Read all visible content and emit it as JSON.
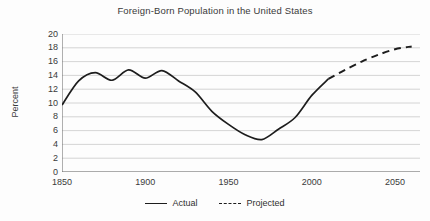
{
  "chart_data": {
    "type": "line",
    "title": "Foreign-Born Population in the United States",
    "xlabel": "",
    "ylabel": "Percent",
    "xlim": [
      1850,
      2065
    ],
    "ylim": [
      0,
      20
    ],
    "xticks": [
      1850,
      1900,
      1950,
      2000,
      2050
    ],
    "xtick_labels": [
      "1850",
      "1900",
      "1950",
      "2000",
      "2050"
    ],
    "yticks": [
      0,
      2,
      4,
      6,
      8,
      10,
      12,
      14,
      16,
      18,
      20
    ],
    "ytick_labels": [
      "0",
      "2",
      "4",
      "6",
      "8",
      "10",
      "12",
      "14",
      "16",
      "18",
      "20"
    ],
    "grid": "horizontal",
    "legend_position": "bottom-center",
    "line_color": "#1d1d1d",
    "grid_color": "#c9c9c9",
    "axis_color": "#6e6e6e",
    "series": [
      {
        "name": "Actual",
        "style": "solid",
        "x": [
          1850,
          1860,
          1870,
          1880,
          1890,
          1900,
          1910,
          1920,
          1930,
          1940,
          1950,
          1960,
          1970,
          1980,
          1990,
          2000,
          2010
        ],
        "values": [
          9.7,
          13.2,
          14.4,
          13.3,
          14.8,
          13.6,
          14.7,
          13.2,
          11.6,
          8.8,
          6.9,
          5.4,
          4.7,
          6.2,
          7.9,
          11.1,
          13.5
        ]
      },
      {
        "name": "Projected",
        "style": "dashed",
        "x": [
          2010,
          2020,
          2030,
          2040,
          2050,
          2060
        ],
        "values": [
          13.5,
          14.8,
          16.0,
          17.0,
          17.8,
          18.2
        ]
      }
    ],
    "legend": [
      {
        "label": "Actual",
        "style": "solid"
      },
      {
        "label": "Projected",
        "style": "dashed"
      }
    ]
  }
}
